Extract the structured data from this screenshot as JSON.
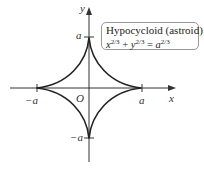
{
  "diagram": {
    "title": "Hypocycloid (astroid)",
    "equation": {
      "x_base": "x",
      "y_base": "y",
      "a_base": "a",
      "exponent": "2/3",
      "plus": "+",
      "equals": "="
    },
    "axes": {
      "x_label": "x",
      "y_label": "y",
      "origin_label": "O"
    },
    "ticks": {
      "x_pos": "a",
      "x_neg": "−a",
      "y_pos": "a",
      "y_neg": "−a"
    },
    "colors": {
      "curve": "#222222",
      "axes": "#333333",
      "box_border": "#999999"
    }
  }
}
